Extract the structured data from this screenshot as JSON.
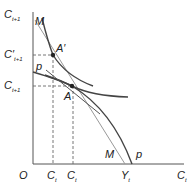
{
  "diagram": {
    "axes": {
      "y_label": "C",
      "y_sub": "t+1",
      "x_label": "C",
      "x_sub": "t",
      "origin": "O"
    },
    "y_ticks": [
      {
        "label": "C",
        "prime": "′",
        "sub": "t+1"
      },
      {
        "label": "C",
        "prime": "",
        "sub": "t+1"
      }
    ],
    "x_ticks": [
      {
        "label": "C",
        "sub": "t"
      },
      {
        "label": "C",
        "sub": "t"
      },
      {
        "label": "Y",
        "sub": "t"
      }
    ],
    "points": {
      "a_prime": "A′",
      "a": "A"
    },
    "curves": {
      "budget_line": "M",
      "budget_line_bottom": "M",
      "ppf": "p",
      "ppf_bottom": "p"
    },
    "colors": {
      "axis": "#555555",
      "curve": "#444444",
      "line": "#999999",
      "dash": "#666666"
    }
  }
}
